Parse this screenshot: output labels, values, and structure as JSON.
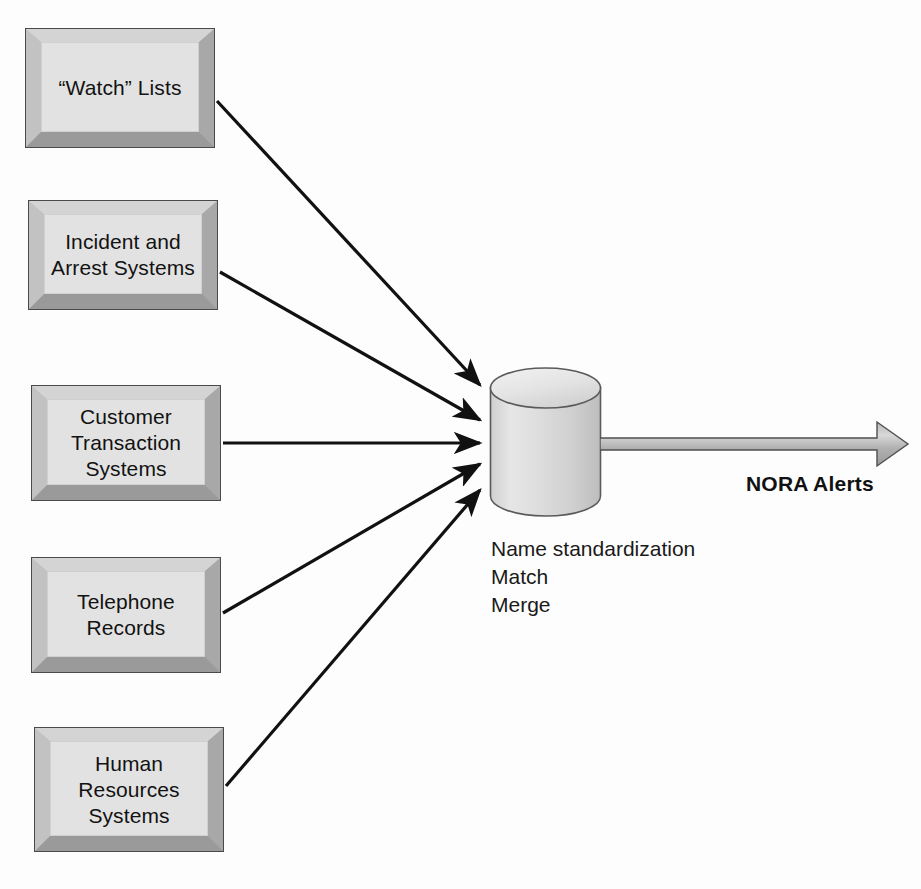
{
  "diagram": {
    "background_color": "#fdfdfd",
    "box_fill_color": "#e2e2e2",
    "box_border_color": "#4a4a4a",
    "arrow_color": "#111111",
    "block_arrow_color": "#a6a6a6"
  },
  "sources": [
    {
      "label": "“Watch” Lists",
      "x": 25,
      "y": 28,
      "w": 190,
      "h": 120
    },
    {
      "label": "Incident and\nArrest Systems",
      "x": 28,
      "y": 200,
      "w": 190,
      "h": 110
    },
    {
      "label": "Customer\nTransaction\nSystems",
      "x": 31,
      "y": 385,
      "w": 190,
      "h": 116
    },
    {
      "label": "Telephone\nRecords",
      "x": 31,
      "y": 557,
      "w": 190,
      "h": 116
    },
    {
      "label": "Human\nResources\nSystems",
      "x": 34,
      "y": 727,
      "w": 190,
      "h": 125
    }
  ],
  "input_arrows": [
    {
      "name": "arrow-watch-lists",
      "x1": 217,
      "y1": 101,
      "x2": 480,
      "y2": 385
    },
    {
      "name": "arrow-incident-arrest",
      "x1": 220,
      "y1": 272,
      "x2": 480,
      "y2": 420
    },
    {
      "name": "arrow-customer-transaction",
      "x1": 223,
      "y1": 443,
      "x2": 480,
      "y2": 443
    },
    {
      "name": "arrow-telephone-records",
      "x1": 223,
      "y1": 613,
      "x2": 480,
      "y2": 464
    },
    {
      "name": "arrow-human-resources",
      "x1": 226,
      "y1": 786,
      "x2": 480,
      "y2": 490
    }
  ],
  "database": {
    "name": "nora-database-cylinder",
    "process_steps": "Name standardization\nMatch\nMerge"
  },
  "output": {
    "label": "NORA Alerts"
  }
}
